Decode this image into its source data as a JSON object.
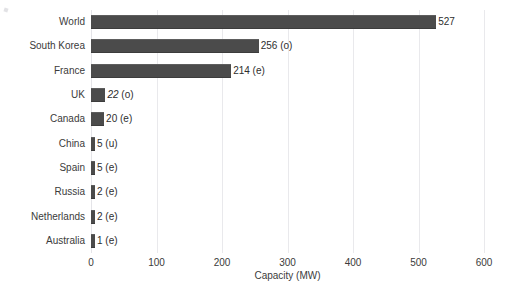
{
  "chart_data": {
    "type": "bar",
    "orientation": "horizontal",
    "title": "",
    "subtitle": "",
    "xlabel": "Capacity (MW)",
    "ylabel": "",
    "xlim": [
      0,
      600
    ],
    "xticks": [
      0,
      100,
      200,
      300,
      400,
      500,
      600
    ],
    "xtick_labels": [
      "0",
      "100",
      "200",
      "300",
      "400",
      "500",
      "600"
    ],
    "grid": true,
    "grid_axis": "x",
    "legend": false,
    "bar_color": "#4b4b4b",
    "categories": [
      "World",
      "South Korea",
      "France",
      "UK",
      "Canada",
      "China",
      "Spain",
      "Russia",
      "Netherlands",
      "Australia"
    ],
    "values": [
      527,
      256,
      214,
      22,
      20,
      5,
      5,
      2,
      2,
      1
    ],
    "data_labels": [
      "527",
      "256 (o)",
      "214 (e)",
      "22 (o)",
      "20 (e)",
      "5 (u)",
      "5 (e)",
      "2 (e)",
      "2 (e)",
      "1 (e)"
    ],
    "bars": [
      {
        "category": "World",
        "value": 527,
        "number": "527",
        "note": "",
        "italic": false
      },
      {
        "category": "South Korea",
        "value": 256,
        "number": "256",
        "note": "(o)",
        "italic": false
      },
      {
        "category": "France",
        "value": 214,
        "number": "214",
        "note": "(e)",
        "italic": false
      },
      {
        "category": "UK",
        "value": 22,
        "number": "22",
        "note": "(o)",
        "italic": true
      },
      {
        "category": "Canada",
        "value": 20,
        "number": "20",
        "note": "(e)",
        "italic": false
      },
      {
        "category": "China",
        "value": 5,
        "number": "5",
        "note": "(u)",
        "italic": false
      },
      {
        "category": "Spain",
        "value": 5,
        "number": "5",
        "note": "(e)",
        "italic": false
      },
      {
        "category": "Russia",
        "value": 2,
        "number": "2",
        "note": "(e)",
        "italic": false
      },
      {
        "category": "Netherlands",
        "value": 2,
        "number": "2",
        "note": "(e)",
        "italic": false
      },
      {
        "category": "Australia",
        "value": 1,
        "number": "1",
        "note": "(e)",
        "italic": false
      }
    ]
  }
}
